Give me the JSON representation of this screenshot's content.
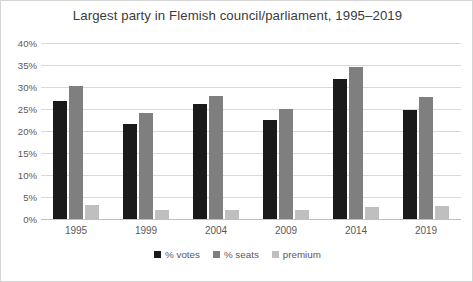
{
  "chart_data": {
    "type": "bar",
    "title": "Largest party in Flemish council/parliament, 1995–2019",
    "xlabel": "",
    "ylabel": "",
    "ylim": [
      0,
      40
    ],
    "ytick_labels": [
      "40%",
      "35%",
      "30%",
      "25%",
      "20%",
      "15%",
      "10%",
      "5%",
      "0%"
    ],
    "ytick_values": [
      40,
      35,
      30,
      25,
      20,
      15,
      10,
      5,
      0
    ],
    "grid": true,
    "legend_position": "bottom",
    "categories": [
      "1995",
      "1999",
      "2004",
      "2009",
      "2014",
      "2019"
    ],
    "series": [
      {
        "name": "% votes",
        "color": "#1a1a1a",
        "values": [
          26.8,
          21.6,
          26.1,
          22.6,
          31.9,
          24.8
        ]
      },
      {
        "name": "% seats",
        "color": "#7f7f7f",
        "values": [
          30.3,
          24.0,
          28.0,
          25.0,
          34.5,
          27.8
        ]
      },
      {
        "name": "premium",
        "color": "#bfbfbf",
        "values": [
          3.2,
          2.0,
          2.0,
          2.0,
          2.8,
          2.9
        ]
      }
    ]
  },
  "axis": {
    "ticks": [
      {
        "label": "40%",
        "value": 40
      },
      {
        "label": "35%",
        "value": 35
      },
      {
        "label": "30%",
        "value": 30
      },
      {
        "label": "25%",
        "value": 25
      },
      {
        "label": "20%",
        "value": 20
      },
      {
        "label": "15%",
        "value": 15
      },
      {
        "label": "10%",
        "value": 10
      },
      {
        "label": "5%",
        "value": 5
      },
      {
        "label": "0%",
        "value": 0
      }
    ]
  }
}
